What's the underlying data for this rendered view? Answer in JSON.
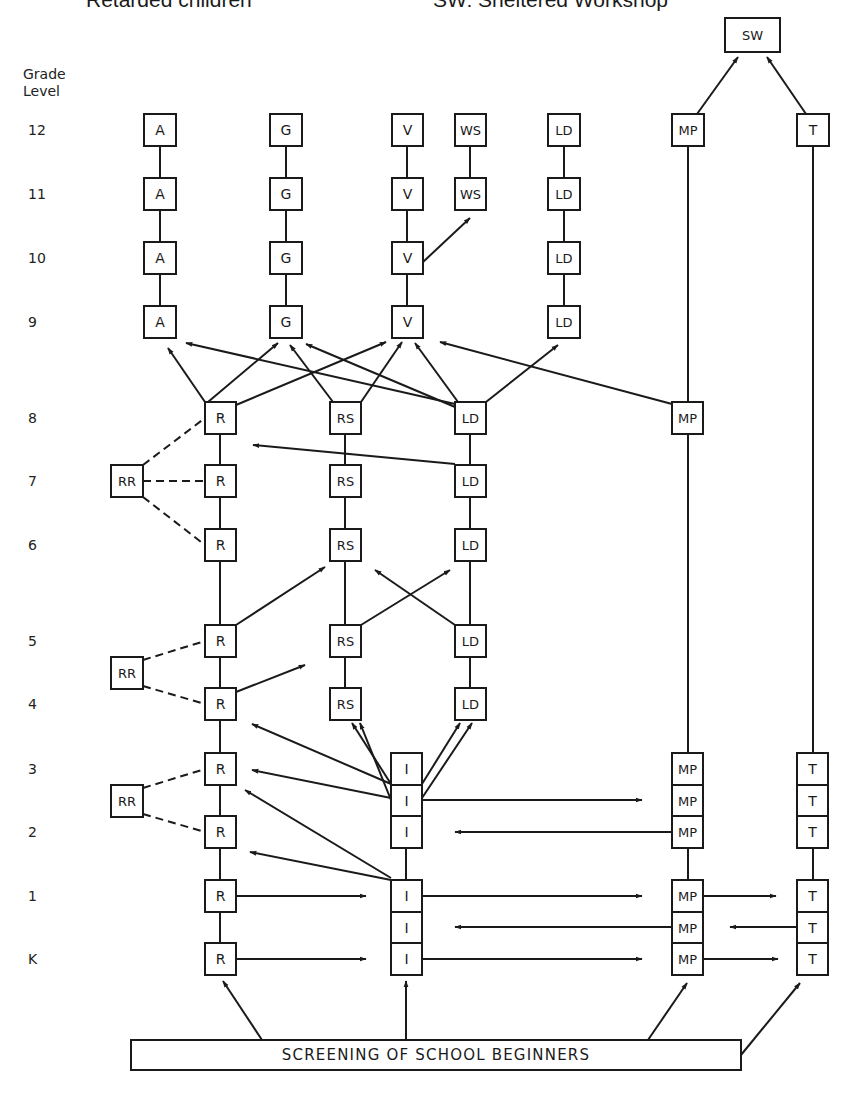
{
  "header": {
    "left_caption": "Retarded children",
    "right_caption": "SW: Sheltered Workshop"
  },
  "axis": {
    "title_line1": "Grade",
    "title_line2": "Level",
    "grades": [
      {
        "label": "12",
        "y": 130
      },
      {
        "label": "11",
        "y": 194
      },
      {
        "label": "10",
        "y": 258
      },
      {
        "label": "9",
        "y": 322
      },
      {
        "label": "8",
        "y": 418
      },
      {
        "label": "7",
        "y": 481
      },
      {
        "label": "6",
        "y": 545
      },
      {
        "label": "5",
        "y": 641
      },
      {
        "label": "4",
        "y": 704
      },
      {
        "label": "3",
        "y": 769
      },
      {
        "label": "2",
        "y": 832
      },
      {
        "label": "1",
        "y": 896
      },
      {
        "label": "K",
        "y": 959
      }
    ]
  },
  "colors": {
    "stroke": "#1a1a1a",
    "background": "#ffffff"
  },
  "nodes": [
    {
      "id": "SW",
      "label": "SW",
      "x": 725,
      "y": 18,
      "w": 55,
      "h": 34
    },
    {
      "id": "A12",
      "label": "A",
      "x": 144,
      "y": 114,
      "w": 32,
      "h": 32
    },
    {
      "id": "A11",
      "label": "A",
      "x": 144,
      "y": 178,
      "w": 32,
      "h": 32
    },
    {
      "id": "A10",
      "label": "A",
      "x": 144,
      "y": 242,
      "w": 32,
      "h": 32
    },
    {
      "id": "A9",
      "label": "A",
      "x": 144,
      "y": 306,
      "w": 32,
      "h": 32
    },
    {
      "id": "G12",
      "label": "G",
      "x": 270,
      "y": 114,
      "w": 32,
      "h": 32
    },
    {
      "id": "G11",
      "label": "G",
      "x": 270,
      "y": 178,
      "w": 32,
      "h": 32
    },
    {
      "id": "G10",
      "label": "G",
      "x": 270,
      "y": 242,
      "w": 32,
      "h": 32
    },
    {
      "id": "G9",
      "label": "G",
      "x": 270,
      "y": 306,
      "w": 32,
      "h": 32
    },
    {
      "id": "V12",
      "label": "V",
      "x": 392,
      "y": 114,
      "w": 31,
      "h": 32
    },
    {
      "id": "V11",
      "label": "V",
      "x": 392,
      "y": 178,
      "w": 31,
      "h": 32
    },
    {
      "id": "V10",
      "label": "V",
      "x": 392,
      "y": 242,
      "w": 31,
      "h": 32
    },
    {
      "id": "V9",
      "label": "V",
      "x": 392,
      "y": 306,
      "w": 31,
      "h": 32
    },
    {
      "id": "WS12",
      "label": "WS",
      "x": 455,
      "y": 114,
      "w": 31,
      "h": 32
    },
    {
      "id": "WS11",
      "label": "WS",
      "x": 455,
      "y": 178,
      "w": 31,
      "h": 32
    },
    {
      "id": "LDt12",
      "label": "LD",
      "x": 548,
      "y": 114,
      "w": 32,
      "h": 32
    },
    {
      "id": "LDt11",
      "label": "LD",
      "x": 548,
      "y": 178,
      "w": 32,
      "h": 32
    },
    {
      "id": "LDt10",
      "label": "LD",
      "x": 548,
      "y": 242,
      "w": 32,
      "h": 32
    },
    {
      "id": "LDt9",
      "label": "LD",
      "x": 548,
      "y": 306,
      "w": 32,
      "h": 32
    },
    {
      "id": "MP12",
      "label": "MP",
      "x": 672,
      "y": 114,
      "w": 32,
      "h": 32
    },
    {
      "id": "T12",
      "label": "T",
      "x": 797,
      "y": 114,
      "w": 32,
      "h": 32
    },
    {
      "id": "R8",
      "label": "R",
      "x": 205,
      "y": 402,
      "w": 31,
      "h": 32
    },
    {
      "id": "R7",
      "label": "R",
      "x": 205,
      "y": 465,
      "w": 31,
      "h": 32
    },
    {
      "id": "R6",
      "label": "R",
      "x": 205,
      "y": 529,
      "w": 31,
      "h": 32
    },
    {
      "id": "R5",
      "label": "R",
      "x": 205,
      "y": 625,
      "w": 31,
      "h": 32
    },
    {
      "id": "R4",
      "label": "R",
      "x": 205,
      "y": 688,
      "w": 31,
      "h": 32
    },
    {
      "id": "R3",
      "label": "R",
      "x": 205,
      "y": 753,
      "w": 31,
      "h": 32
    },
    {
      "id": "R2",
      "label": "R",
      "x": 205,
      "y": 816,
      "w": 31,
      "h": 32
    },
    {
      "id": "R1",
      "label": "R",
      "x": 205,
      "y": 880,
      "w": 31,
      "h": 32
    },
    {
      "id": "RK",
      "label": "R",
      "x": 205,
      "y": 943,
      "w": 31,
      "h": 32
    },
    {
      "id": "RR7",
      "label": "RR",
      "x": 111,
      "y": 465,
      "w": 32,
      "h": 32
    },
    {
      "id": "RR45",
      "label": "RR",
      "x": 111,
      "y": 657,
      "w": 32,
      "h": 32
    },
    {
      "id": "RR23",
      "label": "RR",
      "x": 111,
      "y": 785,
      "w": 32,
      "h": 32
    },
    {
      "id": "RS8",
      "label": "RS",
      "x": 330,
      "y": 402,
      "w": 31,
      "h": 32
    },
    {
      "id": "RS7",
      "label": "RS",
      "x": 330,
      "y": 465,
      "w": 31,
      "h": 32
    },
    {
      "id": "RS6",
      "label": "RS",
      "x": 330,
      "y": 529,
      "w": 31,
      "h": 32
    },
    {
      "id": "RS5",
      "label": "RS",
      "x": 330,
      "y": 625,
      "w": 31,
      "h": 32
    },
    {
      "id": "RS4",
      "label": "RS",
      "x": 330,
      "y": 688,
      "w": 31,
      "h": 32
    },
    {
      "id": "LD8",
      "label": "LD",
      "x": 455,
      "y": 402,
      "w": 31,
      "h": 32
    },
    {
      "id": "LD7",
      "label": "LD",
      "x": 455,
      "y": 465,
      "w": 31,
      "h": 32
    },
    {
      "id": "LD6",
      "label": "LD",
      "x": 455,
      "y": 529,
      "w": 31,
      "h": 32
    },
    {
      "id": "LD5",
      "label": "LD",
      "x": 455,
      "y": 625,
      "w": 31,
      "h": 32
    },
    {
      "id": "LD4",
      "label": "LD",
      "x": 455,
      "y": 688,
      "w": 31,
      "h": 32
    },
    {
      "id": "MP8",
      "label": "MP",
      "x": 672,
      "y": 402,
      "w": 31,
      "h": 32
    },
    {
      "id": "I3",
      "label": "I",
      "x": 391,
      "y": 753,
      "w": 31,
      "h": 32
    },
    {
      "id": "I25",
      "label": "I",
      "x": 391,
      "y": 785,
      "w": 31,
      "h": 31
    },
    {
      "id": "I2",
      "label": "I",
      "x": 391,
      "y": 816,
      "w": 31,
      "h": 32
    },
    {
      "id": "I1",
      "label": "I",
      "x": 391,
      "y": 880,
      "w": 31,
      "h": 32
    },
    {
      "id": "I05",
      "label": "I",
      "x": 391,
      "y": 912,
      "w": 31,
      "h": 31
    },
    {
      "id": "IK",
      "label": "I",
      "x": 391,
      "y": 943,
      "w": 31,
      "h": 32
    },
    {
      "id": "MP3",
      "label": "MP",
      "x": 672,
      "y": 753,
      "w": 31,
      "h": 32
    },
    {
      "id": "MP25",
      "label": "MP",
      "x": 672,
      "y": 785,
      "w": 31,
      "h": 31
    },
    {
      "id": "MP2",
      "label": "MP",
      "x": 672,
      "y": 816,
      "w": 31,
      "h": 32
    },
    {
      "id": "MP1",
      "label": "MP",
      "x": 672,
      "y": 880,
      "w": 31,
      "h": 32
    },
    {
      "id": "MP05",
      "label": "MP",
      "x": 672,
      "y": 912,
      "w": 31,
      "h": 31
    },
    {
      "id": "MPK",
      "label": "MP",
      "x": 672,
      "y": 943,
      "w": 31,
      "h": 32
    },
    {
      "id": "T3",
      "label": "T",
      "x": 797,
      "y": 753,
      "w": 31,
      "h": 32
    },
    {
      "id": "T25",
      "label": "T",
      "x": 797,
      "y": 785,
      "w": 31,
      "h": 31
    },
    {
      "id": "T2",
      "label": "T",
      "x": 797,
      "y": 816,
      "w": 31,
      "h": 32
    },
    {
      "id": "T1",
      "label": "T",
      "x": 797,
      "y": 880,
      "w": 31,
      "h": 32
    },
    {
      "id": "T05",
      "label": "T",
      "x": 797,
      "y": 912,
      "w": 31,
      "h": 31
    },
    {
      "id": "TK",
      "label": "T",
      "x": 797,
      "y": 943,
      "w": 31,
      "h": 32
    },
    {
      "id": "SCREEN",
      "label": "SCREENING OF SCHOOL BEGINNERS",
      "x": 131,
      "y": 1040,
      "w": 610,
      "h": 30,
      "wide": true
    }
  ],
  "lines": [
    [
      160,
      146,
      160,
      178
    ],
    [
      160,
      210,
      160,
      242
    ],
    [
      160,
      274,
      160,
      306
    ],
    [
      286,
      146,
      286,
      178
    ],
    [
      286,
      210,
      286,
      242
    ],
    [
      286,
      274,
      286,
      306
    ],
    [
      407,
      146,
      407,
      178
    ],
    [
      407,
      210,
      407,
      242
    ],
    [
      407,
      274,
      407,
      306
    ],
    [
      470,
      146,
      470,
      178
    ],
    [
      564,
      146,
      564,
      178
    ],
    [
      564,
      210,
      564,
      242
    ],
    [
      564,
      274,
      564,
      306
    ],
    [
      688,
      146,
      688,
      402
    ],
    [
      813,
      146,
      813,
      753
    ],
    [
      220,
      434,
      220,
      465
    ],
    [
      220,
      497,
      220,
      529
    ],
    [
      220,
      561,
      220,
      625
    ],
    [
      220,
      657,
      220,
      688
    ],
    [
      220,
      720,
      220,
      753
    ],
    [
      220,
      785,
      220,
      816
    ],
    [
      220,
      848,
      220,
      880
    ],
    [
      220,
      912,
      220,
      943
    ],
    [
      345,
      434,
      345,
      465
    ],
    [
      345,
      497,
      345,
      529
    ],
    [
      345,
      561,
      345,
      625
    ],
    [
      345,
      657,
      345,
      688
    ],
    [
      470,
      434,
      470,
      465
    ],
    [
      470,
      497,
      470,
      529
    ],
    [
      470,
      561,
      470,
      625
    ],
    [
      470,
      657,
      470,
      688
    ],
    [
      688,
      434,
      688,
      753
    ],
    [
      406,
      848,
      406,
      880
    ],
    [
      688,
      848,
      688,
      880
    ],
    [
      813,
      848,
      813,
      880
    ]
  ],
  "dashed": [
    [
      143,
      465,
      205,
      418
    ],
    [
      143,
      481,
      205,
      481
    ],
    [
      143,
      497,
      205,
      545
    ],
    [
      143,
      660,
      205,
      641
    ],
    [
      143,
      686,
      205,
      704
    ],
    [
      143,
      788,
      205,
      769
    ],
    [
      143,
      814,
      205,
      832
    ]
  ],
  "arrows": [
    [
      697,
      114,
      738,
      57
    ],
    [
      806,
      114,
      767,
      57
    ],
    [
      423,
      262,
      470,
      218
    ],
    [
      205,
      402,
      168,
      348
    ],
    [
      208,
      402,
      278,
      343
    ],
    [
      236,
      405,
      386,
      342
    ],
    [
      333,
      402,
      290,
      345
    ],
    [
      361,
      402,
      402,
      342
    ],
    [
      455,
      404,
      186,
      343
    ],
    [
      455,
      407,
      306,
      344
    ],
    [
      458,
      402,
      415,
      343
    ],
    [
      486,
      402,
      558,
      345
    ],
    [
      672,
      404,
      440,
      342
    ],
    [
      462,
      402,
      462,
      402
    ],
    [
      455,
      464,
      253,
      445
    ],
    [
      236,
      625,
      325,
      567
    ],
    [
      236,
      692,
      305,
      665
    ],
    [
      361,
      625,
      450,
      570
    ],
    [
      455,
      625,
      375,
      570
    ],
    [
      391,
      784,
      252,
      724
    ],
    [
      391,
      798,
      252,
      770
    ],
    [
      391,
      878,
      245,
      790
    ],
    [
      391,
      880,
      250,
      852
    ],
    [
      391,
      784,
      352,
      723
    ],
    [
      391,
      800,
      360,
      723
    ],
    [
      422,
      784,
      460,
      723
    ],
    [
      422,
      798,
      472,
      723
    ],
    [
      422,
      800,
      642,
      800
    ],
    [
      672,
      832,
      455,
      832
    ],
    [
      236,
      896,
      366,
      896
    ],
    [
      236,
      959,
      366,
      959
    ],
    [
      422,
      896,
      642,
      896
    ],
    [
      672,
      927,
      455,
      927
    ],
    [
      422,
      959,
      642,
      959
    ],
    [
      703,
      896,
      776,
      896
    ],
    [
      797,
      927,
      730,
      927
    ],
    [
      703,
      959,
      778,
      959
    ],
    [
      262,
      1040,
      223,
      981
    ],
    [
      406,
      1040,
      406,
      981
    ],
    [
      648,
      1040,
      687,
      983
    ],
    [
      741,
      1055,
      800,
      983
    ]
  ]
}
